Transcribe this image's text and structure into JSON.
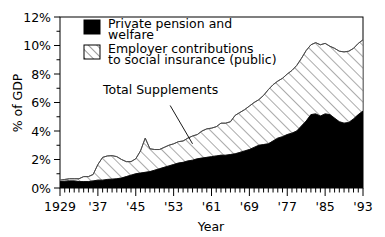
{
  "chart_data": {
    "type": "area",
    "title": "",
    "subtitle": "",
    "xlabel": "Year",
    "ylabel": "% of GDP",
    "xlim": [
      1929,
      1993
    ],
    "ylim": [
      0,
      12
    ],
    "grid": false,
    "stacked": true,
    "legend_position": "top-left-inside",
    "x_tick_labels": [
      "1929",
      "'37",
      "'45",
      "'53",
      "'61",
      "'69",
      "'77",
      "'85",
      "'93"
    ],
    "x_tick_values": [
      1929,
      1937,
      1945,
      1953,
      1961,
      1969,
      1977,
      1985,
      1993
    ],
    "x_minor_tick_step": 1,
    "y_tick_labels": [
      "0%",
      "2%",
      "4%",
      "6%",
      "8%",
      "10%",
      "12%"
    ],
    "y_tick_values": [
      0,
      2,
      4,
      6,
      8,
      10,
      12
    ],
    "y_minor_tick_step": 1,
    "annotations": [
      {
        "text": "Total Supplements",
        "x": 1951,
        "y": 6.0,
        "points_to_x": 1957,
        "points_to_y": 3.1
      }
    ],
    "x": [
      1929,
      1930,
      1931,
      1932,
      1933,
      1934,
      1935,
      1936,
      1937,
      1938,
      1939,
      1940,
      1941,
      1942,
      1943,
      1944,
      1945,
      1946,
      1947,
      1948,
      1949,
      1950,
      1951,
      1952,
      1953,
      1954,
      1955,
      1956,
      1957,
      1958,
      1959,
      1960,
      1961,
      1962,
      1963,
      1964,
      1965,
      1966,
      1967,
      1968,
      1969,
      1970,
      1971,
      1972,
      1973,
      1974,
      1975,
      1976,
      1977,
      1978,
      1979,
      1980,
      1981,
      1982,
      1983,
      1984,
      1985,
      1986,
      1987,
      1988,
      1989,
      1990,
      1991,
      1992,
      1993
    ],
    "series": [
      {
        "name": "Private pension and welfare",
        "fill": "#000000",
        "pattern": "solid",
        "values": [
          0.45,
          0.48,
          0.5,
          0.5,
          0.45,
          0.45,
          0.45,
          0.5,
          0.55,
          0.55,
          0.6,
          0.62,
          0.65,
          0.7,
          0.8,
          0.9,
          1.0,
          1.05,
          1.1,
          1.15,
          1.25,
          1.35,
          1.45,
          1.55,
          1.65,
          1.75,
          1.8,
          1.9,
          1.95,
          2.05,
          2.1,
          2.15,
          2.2,
          2.25,
          2.3,
          2.3,
          2.35,
          2.4,
          2.5,
          2.6,
          2.7,
          2.85,
          3.0,
          3.05,
          3.1,
          3.3,
          3.5,
          3.6,
          3.75,
          3.85,
          4.0,
          4.35,
          4.7,
          5.15,
          5.2,
          5.05,
          5.2,
          5.15,
          4.9,
          4.65,
          4.55,
          4.6,
          4.85,
          5.15,
          5.4
        ]
      },
      {
        "name": "Employer contributions to social insurance (public)",
        "fill": "#ffffff",
        "pattern": "diagonal-hatch",
        "values": [
          0.1,
          0.12,
          0.15,
          0.15,
          0.2,
          0.35,
          0.35,
          0.45,
          1.1,
          1.6,
          1.65,
          1.65,
          1.55,
          1.3,
          1.05,
          0.95,
          1.05,
          1.55,
          2.4,
          1.6,
          1.45,
          1.35,
          1.4,
          1.45,
          1.45,
          1.5,
          1.5,
          1.6,
          1.7,
          1.7,
          1.9,
          2.0,
          2.0,
          2.05,
          2.25,
          2.25,
          2.3,
          2.7,
          2.8,
          2.9,
          3.05,
          3.15,
          3.2,
          3.45,
          3.8,
          3.95,
          4.0,
          4.1,
          4.25,
          4.4,
          4.6,
          4.75,
          4.95,
          4.9,
          5.0,
          5.0,
          4.95,
          4.8,
          4.9,
          4.95,
          5.0,
          5.0,
          4.95,
          5.0,
          5.0
        ]
      }
    ],
    "total_series": {
      "name": "Total Supplements",
      "values": [
        0.55,
        0.6,
        0.65,
        0.65,
        0.65,
        0.8,
        0.8,
        0.95,
        1.65,
        2.15,
        2.25,
        2.27,
        2.2,
        2.0,
        1.85,
        1.85,
        2.05,
        2.6,
        3.5,
        2.75,
        2.7,
        2.7,
        2.85,
        3.0,
        3.1,
        3.25,
        3.3,
        3.5,
        3.65,
        3.75,
        4.0,
        4.15,
        4.2,
        4.3,
        4.55,
        4.55,
        4.65,
        5.1,
        5.3,
        5.5,
        5.75,
        6.0,
        6.2,
        6.5,
        6.9,
        7.25,
        7.5,
        7.7,
        8.0,
        8.25,
        8.6,
        9.1,
        9.65,
        10.05,
        10.2,
        10.05,
        10.15,
        9.95,
        9.8,
        9.6,
        9.55,
        9.6,
        9.8,
        10.15,
        10.4
      ]
    }
  },
  "legend": {
    "items": [
      {
        "label_line1": "Private pension and",
        "label_line2": "welfare",
        "swatch": "solid-black-swatch"
      },
      {
        "label_line1": "Employer contributions",
        "label_line2": "to social insurance (public)",
        "swatch": "hatched-swatch"
      }
    ]
  },
  "axes": {
    "y_title": "% of GDP",
    "x_title": "Year"
  }
}
